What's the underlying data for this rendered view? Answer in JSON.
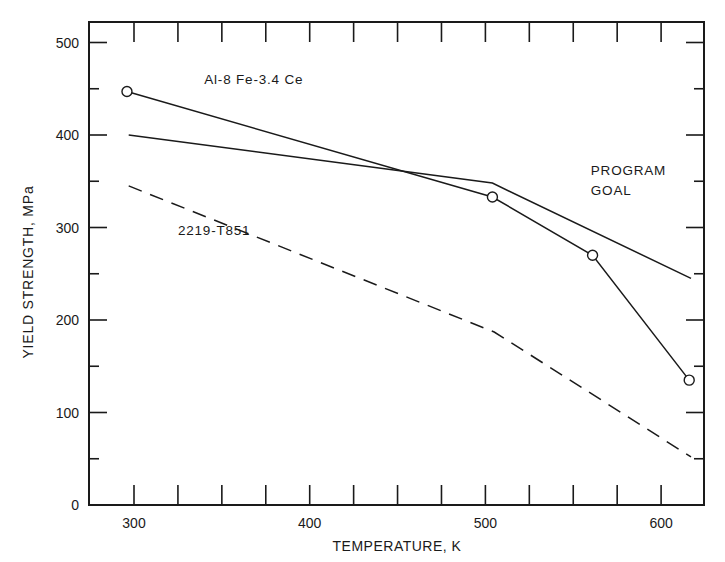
{
  "chart_data": {
    "type": "line",
    "title": "",
    "xlabel": "TEMPERATURE, K",
    "ylabel": "YIELD STRENGTH, MPa",
    "xlim": [
      275,
      625
    ],
    "ylim": [
      0,
      520
    ],
    "x_ticks": [
      300,
      400,
      500,
      600
    ],
    "y_ticks": [
      0,
      100,
      200,
      300,
      400,
      500
    ],
    "x_minor_step": 25,
    "y_minor_step": 50,
    "grid": false,
    "series": [
      {
        "name": "Al-8 Fe-3.4 Ce",
        "style": "solid",
        "marker": "open-circle",
        "x": [
          296,
          504,
          561,
          616
        ],
        "y": [
          447,
          333,
          270,
          135
        ]
      },
      {
        "name": "PROGRAM GOAL",
        "style": "solid",
        "marker": "none",
        "x": [
          297,
          504,
          617
        ],
        "y": [
          400,
          348,
          245
        ]
      },
      {
        "name": "2219-T851",
        "style": "dashed",
        "marker": "none",
        "x": [
          297,
          505,
          617
        ],
        "y": [
          345,
          187,
          52
        ]
      }
    ],
    "annotations": [
      {
        "text": "Al-8 Fe-3.4 Ce",
        "x": 340,
        "y": 455
      },
      {
        "text": "PROGRAM",
        "x": 560,
        "y": 357
      },
      {
        "text": "GOAL",
        "x": 560,
        "y": 335
      },
      {
        "text": "2219-T851",
        "x": 325,
        "y": 292
      }
    ]
  },
  "labels": {
    "xlabel": "TEMPERATURE, K",
    "ylabel": "YIELD STRENGTH, MPa",
    "series_al": "Al-8 Fe-3.4 Ce",
    "goal_line1": "PROGRAM",
    "goal_line2": "GOAL",
    "series_2219": "2219-T851"
  },
  "colors": {
    "ink": "#1a1a1a",
    "background": "#ffffff"
  }
}
